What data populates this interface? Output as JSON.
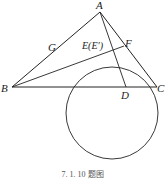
{
  "figure": {
    "caption": "7. 1. 10 题图",
    "points": {
      "A": {
        "label": "A",
        "x": 100,
        "y": 12
      },
      "B": {
        "label": "B",
        "x": 12,
        "y": 87
      },
      "C": {
        "label": "C",
        "x": 157,
        "y": 87
      },
      "D": {
        "label": "D",
        "x": 126,
        "y": 87
      },
      "G": {
        "label": "G",
        "x": 64,
        "y": 48
      },
      "F": {
        "label": "F",
        "x": 124,
        "y": 46
      },
      "E": {
        "label": "E(E′)",
        "x": 104,
        "y": 49
      }
    },
    "segments": [
      "AB",
      "AC",
      "BC",
      "AD",
      "BF"
    ],
    "circle": {
      "cx": 112,
      "cy": 113,
      "r": 46,
      "through": [
        "G",
        "F",
        "C"
      ]
    },
    "colors": {
      "stroke": "#222222",
      "background": "#ffffff"
    }
  }
}
